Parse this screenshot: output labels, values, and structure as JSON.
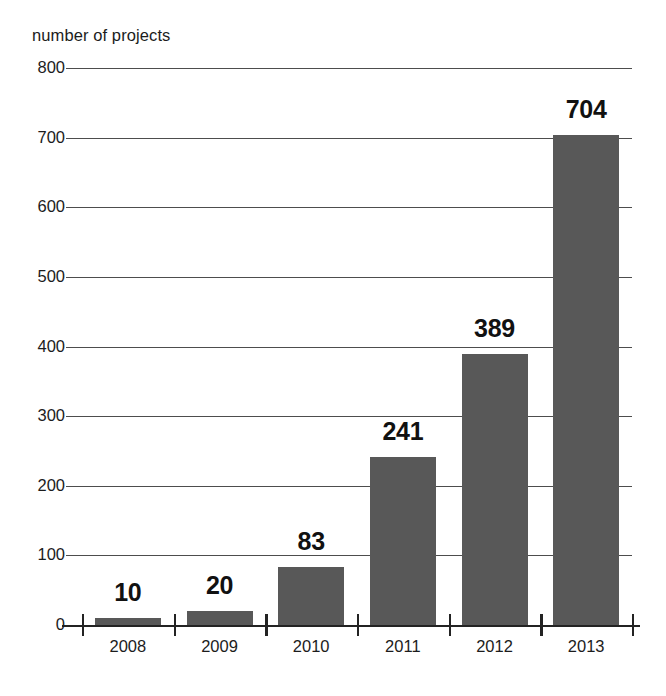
{
  "chart_data": {
    "type": "bar",
    "title": "",
    "subtitle": "",
    "xlabel": "",
    "ylabel": "number of projects",
    "categories": [
      "2008",
      "2009",
      "2010",
      "2011",
      "2012",
      "2013"
    ],
    "values": [
      10,
      20,
      83,
      241,
      389,
      704
    ],
    "value_labels": [
      "10",
      "20",
      "83",
      "241",
      "389",
      "704"
    ],
    "ylim": [
      0,
      800
    ],
    "ytick_labels": [
      "0",
      "100",
      "200",
      "300",
      "400",
      "500",
      "600",
      "700",
      "800"
    ],
    "ytick_values": [
      0,
      100,
      200,
      300,
      400,
      500,
      600,
      700,
      800
    ],
    "grid": "horizontal",
    "legend": "none",
    "bar_color": "#585858",
    "gridline_color": "#4d4d4d",
    "axis_color": "#232323",
    "text_color": "#1c1c1c",
    "background_color": "#ffffff"
  }
}
